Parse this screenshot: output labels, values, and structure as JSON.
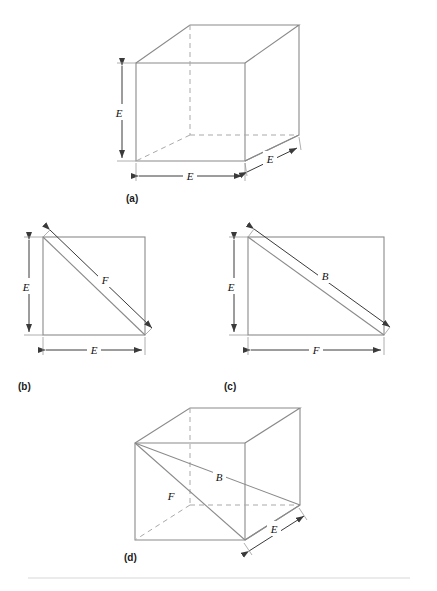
{
  "figure": {
    "type": "geometry-diagram",
    "background": "#ffffff",
    "line_color": "#8a8a8a",
    "hidden_line_color": "#a9a9a9",
    "dimension_color": "#3a3a3a",
    "label_color": "#111111",
    "separator_color": "#d8d8d8"
  },
  "panels": [
    {
      "id": "a",
      "caption": "(a)",
      "shape": "cube",
      "labels": [
        {
          "text": "E",
          "role": "height"
        },
        {
          "text": "E",
          "role": "width"
        },
        {
          "text": "E",
          "role": "depth"
        }
      ]
    },
    {
      "id": "b",
      "caption": "(b)",
      "shape": "square-with-diagonal",
      "labels": [
        {
          "text": "E",
          "role": "height"
        },
        {
          "text": "E",
          "role": "width"
        },
        {
          "text": "F",
          "role": "diagonal"
        }
      ]
    },
    {
      "id": "c",
      "caption": "(c)",
      "shape": "rectangle-with-diagonal",
      "labels": [
        {
          "text": "E",
          "role": "height"
        },
        {
          "text": "F",
          "role": "width"
        },
        {
          "text": "B",
          "role": "diagonal"
        }
      ]
    },
    {
      "id": "d",
      "caption": "(d)",
      "shape": "cube-with-diagonals",
      "labels": [
        {
          "text": "F",
          "role": "face-diagonal"
        },
        {
          "text": "B",
          "role": "body-diagonal"
        },
        {
          "text": "E",
          "role": "depth"
        }
      ]
    }
  ],
  "captions": {
    "a": "(a)",
    "b": "(b)",
    "c": "(c)",
    "d": "(d)"
  },
  "dimension_labels": {
    "a_height": "E",
    "a_width": "E",
    "a_depth": "E",
    "b_height": "E",
    "b_width": "E",
    "b_diagonal": "F",
    "c_height": "E",
    "c_width": "F",
    "c_diagonal": "B",
    "d_face_diagonal": "F",
    "d_body_diagonal": "B",
    "d_depth": "E"
  }
}
